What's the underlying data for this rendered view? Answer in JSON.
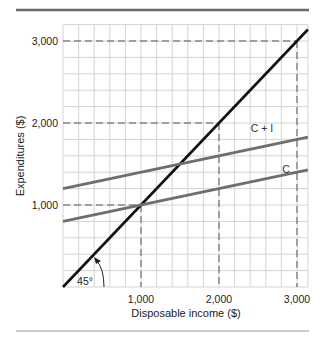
{
  "chart_data": {
    "type": "line",
    "title": "",
    "xlabel": "Disposable income ($)",
    "ylabel": "Expenditures ($)",
    "xlim": [
      0,
      3140
    ],
    "ylim": [
      0,
      3200
    ],
    "x_ticks": [
      1000,
      2000,
      3000
    ],
    "x_tick_labels": [
      "1,000",
      "2,000",
      "3,000"
    ],
    "y_ticks": [
      1000,
      2000,
      3000
    ],
    "y_tick_labels": [
      "1,000",
      "2,000",
      "3,000"
    ],
    "grid": true,
    "grid_step": 200,
    "series": [
      {
        "name": "45° line",
        "color": "#111111",
        "points": [
          [
            0,
            0
          ],
          [
            3140,
            3140
          ]
        ]
      },
      {
        "name": "C + I",
        "label": "C + I",
        "color": "#6e6e6e",
        "intercept": 1200,
        "slope": 0.2,
        "points": [
          [
            0,
            1200
          ],
          [
            3140,
            1828
          ]
        ]
      },
      {
        "name": "C",
        "label": "C",
        "color": "#6e6e6e",
        "intercept": 800,
        "slope": 0.2,
        "points": [
          [
            0,
            800
          ],
          [
            3140,
            1428
          ]
        ]
      }
    ],
    "reference_lines": [
      {
        "x": 1000,
        "y": 1000
      },
      {
        "x": 2000,
        "y": 2000
      },
      {
        "x": 3000,
        "y": 3000
      }
    ],
    "annotations": [
      {
        "text": "45°",
        "x": 280,
        "y": 60
      }
    ]
  },
  "colors": {
    "grid": "#d4d4d4",
    "rule_top": "#6a6a6a",
    "rule_bottom": "#bdbdbd",
    "dashed": "#555555"
  }
}
